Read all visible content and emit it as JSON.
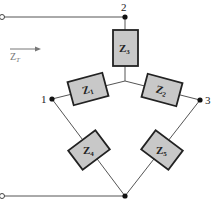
{
  "diagram": {
    "type": "impedance-network",
    "nodes": [
      {
        "id": "1",
        "label": "1"
      },
      {
        "id": "2",
        "label": "2"
      },
      {
        "id": "3",
        "label": "3"
      }
    ],
    "impedances": [
      {
        "id": "Z3",
        "base": "Z",
        "sub": "3"
      },
      {
        "id": "Z1",
        "base": "Z",
        "sub": "1"
      },
      {
        "id": "Z2",
        "base": "Z",
        "sub": "2"
      },
      {
        "id": "Z4",
        "base": "Z",
        "sub": "4"
      },
      {
        "id": "Z5",
        "base": "Z",
        "sub": "5"
      }
    ],
    "input_arrow": {
      "base": "Z",
      "sub": "T"
    },
    "colors": {
      "box_fill": "#c8c8c8",
      "box_stroke": "#222222",
      "wire": "#555555"
    }
  }
}
